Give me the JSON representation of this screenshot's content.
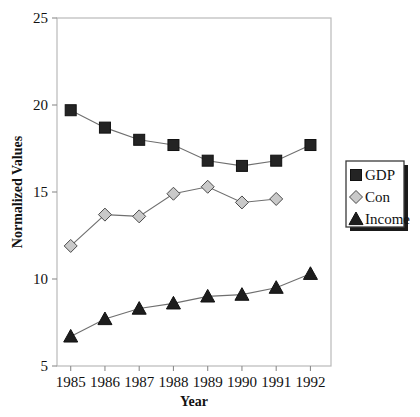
{
  "chart_data": {
    "type": "line",
    "title": "",
    "xlabel": "Year",
    "ylabel": "Normalized Values",
    "categories": [
      1985,
      1986,
      1987,
      1988,
      1989,
      1990,
      1991,
      1992
    ],
    "x_tick_labels": [
      "1985",
      "1986",
      "1987",
      "1988",
      "1989",
      "1990",
      "1991",
      "1992"
    ],
    "y_tick_labels": [
      "5",
      "10",
      "15",
      "20",
      "25"
    ],
    "y_ticks": [
      5,
      10,
      15,
      20,
      25
    ],
    "ylim": [
      5,
      25
    ],
    "xlim": [
      1984.6,
      1992.6
    ],
    "grid": false,
    "legend_position": "right",
    "series": [
      {
        "name": "GDP",
        "marker": "square",
        "marker_color": "#242424",
        "x": [
          1985,
          1986,
          1987,
          1988,
          1989,
          1990,
          1991,
          1992
        ],
        "values": [
          19.7,
          18.7,
          18.0,
          17.7,
          16.8,
          16.5,
          16.8,
          17.7
        ]
      },
      {
        "name": "Con",
        "marker": "diamond",
        "marker_color": "#c9c9c9",
        "x": [
          1985,
          1986,
          1987,
          1988,
          1989,
          1990,
          1991
        ],
        "values": [
          11.9,
          13.7,
          13.6,
          14.9,
          15.3,
          14.4,
          14.6
        ]
      },
      {
        "name": "Income",
        "marker": "triangle",
        "marker_color": "#1d1d1d",
        "x": [
          1985,
          1986,
          1987,
          1988,
          1989,
          1990,
          1991,
          1992
        ],
        "values": [
          6.7,
          7.7,
          8.3,
          8.6,
          9.0,
          9.1,
          9.5,
          10.3
        ]
      }
    ]
  },
  "legend": {
    "entries": [
      {
        "label": "GDP"
      },
      {
        "label": "Con"
      },
      {
        "label": "Income"
      }
    ]
  },
  "colors": {
    "frame": "#b9b9b9",
    "line": "#6f6f6f",
    "gdp": "#242424",
    "con": "#c9c9c9",
    "income": "#1d1d1d",
    "text": "#111111"
  }
}
